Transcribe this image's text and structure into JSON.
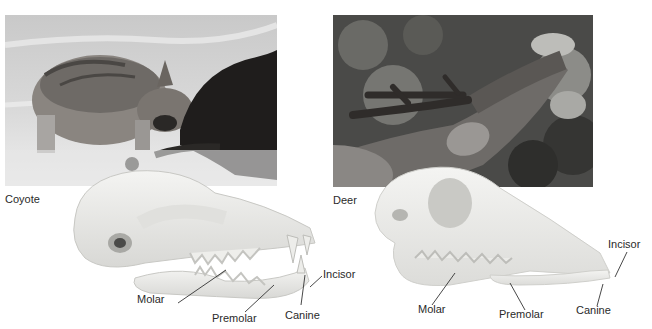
{
  "panels": [
    {
      "id": "coyote",
      "caption": "Coyote",
      "photo_desc": "Coyote feeding on a dark-furred carcass in snow",
      "labels": {
        "molar": "Molar",
        "premolar": "Premolar",
        "canine": "Canine",
        "incisor": "Incisor"
      }
    },
    {
      "id": "deer",
      "caption": "Deer",
      "photo_desc": "Deer with velvet antlers browsing leaves",
      "labels": {
        "molar": "Molar",
        "premolar": "Premolar",
        "canine": "Canine",
        "incisor": "Incisor"
      }
    }
  ],
  "colors": {
    "background": "#ffffff",
    "skull": "#ececea",
    "leader_line": "#333333",
    "text": "#2a2a2a"
  }
}
